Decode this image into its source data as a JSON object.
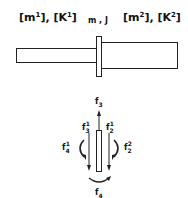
{
  "diagram": {
    "left_segment": {
      "mass_label": "m",
      "mass_index": "1",
      "stiffness_label": "K",
      "stiffness_index": "1"
    },
    "junction": {
      "label": "m , J"
    },
    "right_segment": {
      "mass_label": "m",
      "mass_index": "2",
      "stiffness_label": "K",
      "stiffness_index": "2"
    },
    "forces": {
      "f3": {
        "base": "f",
        "sub": "3"
      },
      "f3_1": {
        "base": "f",
        "sub": "3",
        "sup": "1"
      },
      "f2_1": {
        "base": "f",
        "sub": "2",
        "sup": "1"
      },
      "f4_1": {
        "base": "f",
        "sub": "4",
        "sup": "1"
      },
      "f2_2": {
        "base": "f",
        "sub": "2",
        "sup": "2"
      },
      "f4": {
        "base": "f",
        "sub": "4"
      }
    }
  }
}
